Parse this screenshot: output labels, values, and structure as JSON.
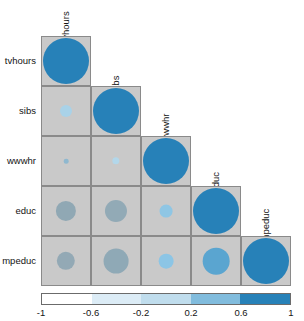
{
  "chart_data": {
    "type": "heatmap",
    "title": "",
    "subtitle": "",
    "xlabel": "",
    "ylabel": "",
    "variables": [
      "tvhours",
      "sibs",
      "wwwhr",
      "educ",
      "mpeduc"
    ],
    "layout": "lower-triangle-with-diagonal",
    "diagonal_labels_rotated": true,
    "grid": true,
    "legend_position": "bottom",
    "matrix": [
      [
        1.0,
        null,
        null,
        null,
        null
      ],
      [
        0.16,
        1.0,
        null,
        null,
        null
      ],
      [
        0.04,
        0.1,
        1.0,
        null,
        null
      ],
      [
        -0.29,
        -0.34,
        0.18,
        1.0,
        null
      ],
      [
        -0.25,
        -0.4,
        0.22,
        0.46,
        1.0
      ]
    ],
    "cells": [
      {
        "row": "tvhours",
        "col": "tvhours",
        "value": 1.0,
        "radius_frac": 1.0,
        "color": "#2781b8"
      },
      {
        "row": "sibs",
        "col": "tvhours",
        "value": 0.16,
        "radius_frac": 0.26,
        "color": "#a9d2e8"
      },
      {
        "row": "sibs",
        "col": "sibs",
        "value": 1.0,
        "radius_frac": 1.0,
        "color": "#2781b8"
      },
      {
        "row": "wwwhr",
        "col": "tvhours",
        "value": 0.04,
        "radius_frac": 0.1,
        "color": "#8fb8cf"
      },
      {
        "row": "wwwhr",
        "col": "sibs",
        "value": 0.1,
        "radius_frac": 0.16,
        "color": "#b3d7ea"
      },
      {
        "row": "wwwhr",
        "col": "wwwhr",
        "value": 1.0,
        "radius_frac": 1.0,
        "color": "#2781b8"
      },
      {
        "row": "educ",
        "col": "tvhours",
        "value": -0.29,
        "radius_frac": 0.44,
        "color": "#90a8b4"
      },
      {
        "row": "educ",
        "col": "sibs",
        "value": -0.34,
        "radius_frac": 0.48,
        "color": "#92aab6"
      },
      {
        "row": "educ",
        "col": "wwwhr",
        "value": 0.18,
        "radius_frac": 0.28,
        "color": "#8fc6e4"
      },
      {
        "row": "educ",
        "col": "educ",
        "value": 1.0,
        "radius_frac": 1.0,
        "color": "#2781b8"
      },
      {
        "row": "mpeduc",
        "col": "tvhours",
        "value": -0.25,
        "radius_frac": 0.4,
        "color": "#93a9b5"
      },
      {
        "row": "mpeduc",
        "col": "sibs",
        "value": -0.4,
        "radius_frac": 0.54,
        "color": "#8fa9b6"
      },
      {
        "row": "mpeduc",
        "col": "wwwhr",
        "value": 0.22,
        "radius_frac": 0.32,
        "color": "#8cc5e5"
      },
      {
        "row": "mpeduc",
        "col": "educ",
        "value": 0.46,
        "radius_frac": 0.58,
        "color": "#5aa5d0"
      },
      {
        "row": "mpeduc",
        "col": "mpeduc",
        "value": 1.0,
        "radius_frac": 1.0,
        "color": "#2781b8"
      }
    ],
    "colorbar": {
      "ticks": [
        "-1",
        "-0.6",
        "-0.2",
        "0.2",
        "0.6",
        "1"
      ],
      "tick_values": [
        -1,
        -0.6,
        -0.2,
        0.2,
        0.6,
        1
      ],
      "range": [
        -1,
        1
      ],
      "segments": [
        "#ffffff",
        "#dcecf6",
        "#c0dded",
        "#81bcdd",
        "#2781b8"
      ]
    }
  },
  "colors": {
    "cell_background": "#c9c9c9",
    "cell_border": "#8a8a8a",
    "accent": "#2781b8",
    "text": "#141414",
    "page_background": "#ffffff"
  }
}
